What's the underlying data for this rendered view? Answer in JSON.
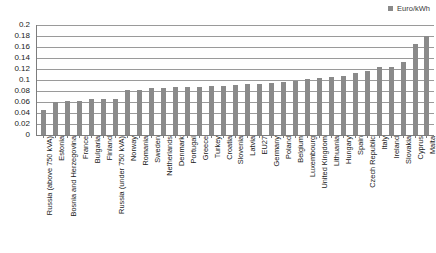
{
  "legend": {
    "entries": [
      {
        "label": "Euro/kWh",
        "color": "#8a8a8a",
        "marker": "square-marker"
      }
    ],
    "position": "top-right"
  },
  "axis": {
    "y_ticks": [
      "0",
      "0.02",
      "0.04",
      "0.06",
      "0.08",
      "0.1",
      "0.12",
      "0.14",
      "0.16",
      "0.18",
      "0.2"
    ]
  },
  "chart_data": {
    "type": "bar",
    "title": "",
    "subtitle": "",
    "xlabel": "",
    "ylabel": "",
    "ylim": [
      0,
      0.2
    ],
    "ytick_step": 0.02,
    "grid": true,
    "legend_position": "top-right",
    "series": [
      {
        "name": "Euro/kWh",
        "color": "#8a8a8a",
        "values": [
          0.045,
          0.06,
          0.061,
          0.062,
          0.065,
          0.066,
          0.066,
          0.081,
          0.082,
          0.085,
          0.086,
          0.087,
          0.088,
          0.088,
          0.089,
          0.09,
          0.091,
          0.092,
          0.093,
          0.094,
          0.097,
          0.099,
          0.101,
          0.103,
          0.105,
          0.108,
          0.112,
          0.117,
          0.123,
          0.124,
          0.133,
          0.165,
          0.18
        ]
      }
    ],
    "categories": [
      "Russia (above 750 kVA)",
      "Estonia",
      "Bosnia and Herzegovina",
      "France",
      "Bulgaria",
      "Finland",
      "Russia (under 750 kVA)",
      "Norway",
      "Romania",
      "Sweden",
      "Netherlands",
      "Denmark",
      "Portugal",
      "Greece",
      "Turkey",
      "Croatia",
      "Slovenia",
      "Latvia",
      "EU27",
      "Germany",
      "Poland",
      "Belgium",
      "Luxembourg",
      "United Kingdom",
      "Lithuania",
      "Hungary",
      "Spain",
      "Czech Republic",
      "Italy",
      "Ireland",
      "Slovakia",
      "Cyprus",
      "Malta"
    ]
  }
}
